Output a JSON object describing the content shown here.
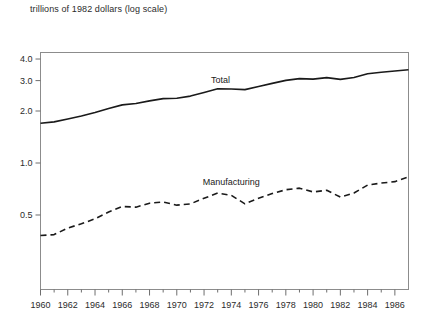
{
  "caption": "trillions of 1982 dollars (log scale)",
  "chart_data": {
    "type": "line",
    "title": "",
    "subtitle": "",
    "xlabel": "",
    "ylabel": "trillions of 1982 dollars (log scale)",
    "yscale": "log",
    "grid": false,
    "legend": "inline-labels",
    "xlim": [
      1960,
      1987
    ],
    "ylim": [
      0.3,
      4.6
    ],
    "yticks": [
      0.5,
      1.0,
      2.0,
      3.0,
      4.0
    ],
    "ytick_labels": [
      "0.5",
      "1.0",
      "2.0",
      "3.0",
      "4.0"
    ],
    "xticks": [
      1960,
      1962,
      1964,
      1966,
      1968,
      1970,
      1972,
      1974,
      1976,
      1978,
      1980,
      1982,
      1984,
      1986
    ],
    "xtick_labels": [
      "1960",
      "1962",
      "1964",
      "1966",
      "1968",
      "1970",
      "1972",
      "1974",
      "1976",
      "1978",
      "1980",
      "1982",
      "1984",
      "1986"
    ],
    "xminor_ticks": [
      1961,
      1963,
      1965,
      1967,
      1969,
      1971,
      1973,
      1975,
      1977,
      1979,
      1981,
      1983,
      1985,
      1987
    ],
    "x": [
      1960,
      1961,
      1962,
      1963,
      1964,
      1965,
      1966,
      1967,
      1968,
      1969,
      1970,
      1971,
      1972,
      1973,
      1974,
      1975,
      1976,
      1977,
      1978,
      1979,
      1980,
      1981,
      1982,
      1983,
      1984,
      1985,
      1986,
      1987
    ],
    "series": [
      {
        "name": "Total",
        "style": "solid",
        "color": "#1a1a1a",
        "label_x": 1973.2,
        "label_y": 2.92,
        "values": [
          1.7,
          1.73,
          1.8,
          1.87,
          1.96,
          2.07,
          2.17,
          2.21,
          2.29,
          2.36,
          2.37,
          2.44,
          2.56,
          2.69,
          2.68,
          2.66,
          2.77,
          2.89,
          3.01,
          3.08,
          3.06,
          3.12,
          3.05,
          3.13,
          3.29,
          3.35,
          3.41,
          3.47
        ]
      },
      {
        "name": "Manufacturing",
        "style": "dashed",
        "color": "#1a1a1a",
        "label_x": 1974.0,
        "label_y": 0.745,
        "values": [
          0.38,
          0.385,
          0.42,
          0.445,
          0.475,
          0.52,
          0.56,
          0.555,
          0.585,
          0.595,
          0.57,
          0.58,
          0.625,
          0.67,
          0.65,
          0.58,
          0.625,
          0.665,
          0.7,
          0.715,
          0.68,
          0.695,
          0.635,
          0.67,
          0.745,
          0.765,
          0.78,
          0.83
        ]
      }
    ]
  }
}
